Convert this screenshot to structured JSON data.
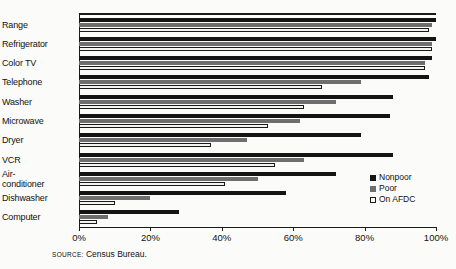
{
  "chart_data": {
    "type": "bar",
    "orientation": "horizontal",
    "title": "",
    "subtitle": "",
    "xlabel": "",
    "ylabel": "",
    "xlim": [
      0,
      100
    ],
    "x_tick_labels": [
      "0%",
      "20%",
      "40%",
      "60%",
      "80%",
      "100%"
    ],
    "x_tick_values": [
      0,
      20,
      40,
      60,
      80,
      100
    ],
    "grid": false,
    "legend_position": "inside-right",
    "categories": [
      "Range",
      "Refrigerator",
      "Color TV",
      "Telephone",
      "Washer",
      "Microwave",
      "Dryer",
      "VCR",
      "Air-conditioner",
      "Dishwasher",
      "Computer"
    ],
    "series": [
      {
        "name": "Nonpoor",
        "color": "#141414",
        "values": [
          100,
          100,
          99,
          98,
          88,
          87,
          79,
          88,
          72,
          58,
          28
        ]
      },
      {
        "name": "Poor",
        "color": "#6e6e6e",
        "values": [
          99,
          99,
          97,
          79,
          72,
          62,
          47,
          63,
          50,
          20,
          8
        ]
      },
      {
        "name": "On AFDC",
        "color": "#f4f4f1",
        "values": [
          98,
          99,
          97,
          68,
          63,
          53,
          37,
          55,
          41,
          10,
          5
        ]
      }
    ],
    "source_prefix": "SOURCE:",
    "source_text": "Census Bureau."
  },
  "category_labels": [
    {
      "line1": "Range",
      "line2": ""
    },
    {
      "line1": "Refrigerator",
      "line2": ""
    },
    {
      "line1": "Color TV",
      "line2": ""
    },
    {
      "line1": "Telephone",
      "line2": ""
    },
    {
      "line1": "Washer",
      "line2": ""
    },
    {
      "line1": "Microwave",
      "line2": ""
    },
    {
      "line1": "Dryer",
      "line2": ""
    },
    {
      "line1": "VCR",
      "line2": ""
    },
    {
      "line1": "Air-",
      "line2": "conditioner"
    },
    {
      "line1": "Dishwasher",
      "line2": ""
    },
    {
      "line1": "Computer",
      "line2": ""
    }
  ]
}
